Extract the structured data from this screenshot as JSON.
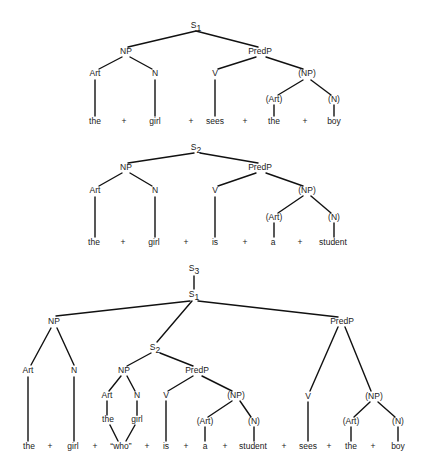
{
  "diagram": {
    "type": "syntax-tree-figure",
    "trees": [
      {
        "id": "tree-s1",
        "root": "S1",
        "nodes": [
          {
            "id": "S1",
            "label": "S",
            "sub": "1",
            "x": 196,
            "y": 26
          },
          {
            "id": "NP",
            "label": "NP",
            "x": 126,
            "y": 52
          },
          {
            "id": "PredP",
            "label": "PredP",
            "x": 260,
            "y": 52
          },
          {
            "id": "Art",
            "label": "Art",
            "x": 95,
            "y": 74
          },
          {
            "id": "N",
            "label": "N",
            "x": 155,
            "y": 74
          },
          {
            "id": "V",
            "label": "V",
            "x": 215,
            "y": 74
          },
          {
            "id": "NP2",
            "label": "(NP)",
            "x": 307,
            "y": 74
          },
          {
            "id": "Art2",
            "label": "(Art)",
            "x": 274,
            "y": 100
          },
          {
            "id": "N2",
            "label": "(N)",
            "x": 334,
            "y": 100
          }
        ],
        "words": [
          {
            "text": "the",
            "x": 95,
            "y": 122
          },
          {
            "text": "+",
            "x": 124,
            "y": 122
          },
          {
            "text": "girl",
            "x": 155,
            "y": 122
          },
          {
            "text": "+",
            "x": 191,
            "y": 122
          },
          {
            "text": "sees",
            "x": 215,
            "y": 122
          },
          {
            "text": "+",
            "x": 245,
            "y": 122
          },
          {
            "text": "the",
            "x": 274,
            "y": 122
          },
          {
            "text": "+",
            "x": 305,
            "y": 122
          },
          {
            "text": "boy",
            "x": 334,
            "y": 122
          }
        ],
        "edges": [
          [
            196,
            31,
            128,
            47
          ],
          [
            196,
            31,
            258,
            47
          ],
          [
            122,
            57,
            99,
            69
          ],
          [
            130,
            57,
            152,
            69
          ],
          [
            256,
            57,
            218,
            69
          ],
          [
            266,
            57,
            303,
            69
          ],
          [
            95,
            80,
            95,
            116
          ],
          [
            155,
            80,
            155,
            116
          ],
          [
            215,
            80,
            215,
            116
          ],
          [
            303,
            80,
            278,
            95
          ],
          [
            311,
            80,
            331,
            95
          ],
          [
            274,
            105,
            274,
            116
          ],
          [
            334,
            105,
            334,
            116
          ]
        ]
      },
      {
        "id": "tree-s2",
        "root": "S2",
        "nodes": [
          {
            "id": "S2",
            "label": "S",
            "sub": "2",
            "x": 196,
            "y": 148
          },
          {
            "id": "NP",
            "label": "NP",
            "x": 126,
            "y": 168
          },
          {
            "id": "PredP",
            "label": "PredP",
            "x": 260,
            "y": 168
          },
          {
            "id": "Art",
            "label": "Art",
            "x": 95,
            "y": 191
          },
          {
            "id": "N",
            "label": "N",
            "x": 155,
            "y": 191
          },
          {
            "id": "V",
            "label": "V",
            "x": 215,
            "y": 191
          },
          {
            "id": "NP2",
            "label": "(NP)",
            "x": 307,
            "y": 191
          },
          {
            "id": "Art2",
            "label": "(Art)",
            "x": 274,
            "y": 218
          },
          {
            "id": "N2",
            "label": "(N)",
            "x": 334,
            "y": 218
          }
        ],
        "words": [
          {
            "text": "the",
            "x": 94,
            "y": 243
          },
          {
            "text": "+",
            "x": 123,
            "y": 243
          },
          {
            "text": "girl",
            "x": 154,
            "y": 243
          },
          {
            "text": "+",
            "x": 186,
            "y": 243
          },
          {
            "text": "is",
            "x": 215,
            "y": 243
          },
          {
            "text": "+",
            "x": 245,
            "y": 243
          },
          {
            "text": "a",
            "x": 273,
            "y": 243
          },
          {
            "text": "+",
            "x": 300,
            "y": 243
          },
          {
            "text": "student",
            "x": 333,
            "y": 243
          }
        ],
        "edges": [
          [
            194,
            153,
            128,
            163
          ],
          [
            200,
            153,
            258,
            163
          ],
          [
            122,
            173,
            99,
            186
          ],
          [
            130,
            173,
            152,
            186
          ],
          [
            256,
            173,
            218,
            186
          ],
          [
            266,
            173,
            303,
            186
          ],
          [
            95,
            197,
            95,
            237
          ],
          [
            155,
            197,
            155,
            237
          ],
          [
            215,
            197,
            215,
            237
          ],
          [
            303,
            196,
            278,
            213
          ],
          [
            311,
            196,
            331,
            213
          ],
          [
            274,
            223,
            274,
            237
          ],
          [
            334,
            223,
            334,
            237
          ]
        ]
      },
      {
        "id": "tree-s3",
        "root": "S3",
        "nodes": [
          {
            "id": "S3",
            "label": "S",
            "sub": "3",
            "x": 194,
            "y": 269
          },
          {
            "id": "S1",
            "label": "S",
            "sub": "1",
            "x": 194,
            "y": 295
          },
          {
            "id": "NP",
            "label": "NP",
            "x": 54,
            "y": 322
          },
          {
            "id": "PredP",
            "label": "PredP",
            "x": 342,
            "y": 322
          },
          {
            "id": "S2",
            "label": "S",
            "sub": "2",
            "x": 155,
            "y": 348
          },
          {
            "id": "Art",
            "label": "Art",
            "x": 28,
            "y": 371
          },
          {
            "id": "N",
            "label": "N",
            "x": 74,
            "y": 371
          },
          {
            "id": "NPrel",
            "label": "NP",
            "x": 124,
            "y": 371
          },
          {
            "id": "PredPrel",
            "label": "PredP",
            "x": 197,
            "y": 371
          },
          {
            "id": "ArtRel",
            "label": "Art",
            "x": 107,
            "y": 396
          },
          {
            "id": "NRel",
            "label": "N",
            "x": 137,
            "y": 396
          },
          {
            "id": "Vrel",
            "label": "V",
            "x": 166,
            "y": 396
          },
          {
            "id": "NPrel2",
            "label": "(NP)",
            "x": 236,
            "y": 396
          },
          {
            "id": "Vmain",
            "label": "V",
            "x": 308,
            "y": 397
          },
          {
            "id": "NPmain2",
            "label": "(NP)",
            "x": 374,
            "y": 397
          },
          {
            "id": "theRel",
            "label": "the",
            "x": 108,
            "y": 420
          },
          {
            "id": "girlRel",
            "label": "girl",
            "x": 137,
            "y": 420
          },
          {
            "id": "ArtRel2",
            "label": "(Art)",
            "x": 205,
            "y": 422
          },
          {
            "id": "NRel2",
            "label": "(N)",
            "x": 254,
            "y": 422
          },
          {
            "id": "ArtMain2",
            "label": "(Art)",
            "x": 351,
            "y": 422
          },
          {
            "id": "NMain2",
            "label": "(N)",
            "x": 398,
            "y": 422
          }
        ],
        "words": [
          {
            "text": "the",
            "x": 29,
            "y": 447
          },
          {
            "text": "+",
            "x": 50,
            "y": 447
          },
          {
            "text": "girl",
            "x": 73,
            "y": 447
          },
          {
            "text": "+",
            "x": 95,
            "y": 447
          },
          {
            "text": "“who”",
            "x": 121,
            "y": 447
          },
          {
            "text": "+",
            "x": 147,
            "y": 447
          },
          {
            "text": "is",
            "x": 166,
            "y": 447
          },
          {
            "text": "+",
            "x": 186,
            "y": 447
          },
          {
            "text": "a",
            "x": 205,
            "y": 447
          },
          {
            "text": "+",
            "x": 225,
            "y": 447
          },
          {
            "text": "student",
            "x": 253,
            "y": 447
          },
          {
            "text": "+",
            "x": 284,
            "y": 447
          },
          {
            "text": "sees",
            "x": 308,
            "y": 447
          },
          {
            "text": "+",
            "x": 329,
            "y": 447
          },
          {
            "text": "the",
            "x": 351,
            "y": 447
          },
          {
            "text": "+",
            "x": 373,
            "y": 447
          },
          {
            "text": "boy",
            "x": 398,
            "y": 447
          }
        ],
        "edges": [
          [
            194,
            276,
            194,
            289
          ],
          [
            190,
            301,
            56,
            316
          ],
          [
            198,
            301,
            338,
            317
          ],
          [
            192,
            301,
            157,
            342
          ],
          [
            51,
            328,
            31,
            365
          ],
          [
            57,
            328,
            74,
            365
          ],
          [
            151,
            353,
            127,
            366
          ],
          [
            160,
            353,
            193,
            366
          ],
          [
            121,
            376,
            109,
            391
          ],
          [
            127,
            376,
            135,
            391
          ],
          [
            193,
            376,
            168,
            391
          ],
          [
            202,
            376,
            232,
            391
          ],
          [
            338,
            327,
            310,
            391
          ],
          [
            345,
            327,
            371,
            391
          ],
          [
            28,
            377,
            28,
            441
          ],
          [
            74,
            377,
            74,
            441
          ],
          [
            107,
            401,
            107,
            415
          ],
          [
            137,
            401,
            137,
            415
          ],
          [
            110,
            425,
            118,
            441
          ],
          [
            135,
            425,
            126,
            441
          ],
          [
            166,
            401,
            166,
            441
          ],
          [
            232,
            401,
            208,
            417
          ],
          [
            240,
            401,
            251,
            417
          ],
          [
            205,
            427,
            205,
            441
          ],
          [
            254,
            427,
            254,
            441
          ],
          [
            308,
            402,
            308,
            441
          ],
          [
            370,
            402,
            354,
            417
          ],
          [
            378,
            402,
            395,
            417
          ],
          [
            351,
            427,
            351,
            441
          ],
          [
            398,
            427,
            398,
            441
          ]
        ]
      }
    ]
  }
}
